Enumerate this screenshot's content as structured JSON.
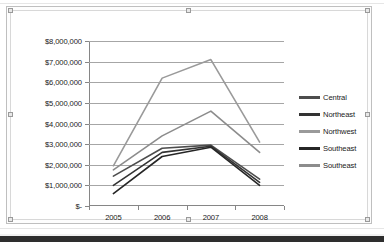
{
  "chart_data": {
    "type": "line",
    "title": "",
    "xlabel": "",
    "ylabel": "",
    "x": [
      "2005",
      "2006",
      "2007",
      "2008"
    ],
    "categories": [
      "2005",
      "2006",
      "2007",
      "2008"
    ],
    "ylim": [
      0,
      8000000
    ],
    "ytick_step": 1000000,
    "ytick_labels": [
      "$-",
      "$1,000,000",
      "$2,000,000",
      "$3,000,000",
      "$4,000,000",
      "$5,000,000",
      "$6,000,000",
      "$7,000,000",
      "$8,000,000"
    ],
    "ytick_values": [
      0,
      1000000,
      2000000,
      3000000,
      4000000,
      5000000,
      6000000,
      7000000,
      8000000
    ],
    "grid": "horizontal",
    "legend_position": "right",
    "series": [
      {
        "name": "Central",
        "color": "#4d4d4d",
        "values": [
          1450000,
          2800000,
          2950000,
          1300000
        ]
      },
      {
        "name": "Northeast",
        "color": "#333333",
        "values": [
          1000000,
          2600000,
          2900000,
          1150000
        ]
      },
      {
        "name": "Northwest",
        "color": "#9a9a9a",
        "values": [
          1950000,
          6200000,
          7100000,
          3100000
        ]
      },
      {
        "name": "Southeast",
        "color": "#262626",
        "values": [
          600000,
          2400000,
          2850000,
          1000000
        ]
      },
      {
        "name": "Southeast",
        "color": "#8c8c8c",
        "values": [
          1750000,
          3400000,
          4600000,
          2600000
        ]
      }
    ]
  },
  "legend": {
    "items": [
      {
        "label": "Central"
      },
      {
        "label": "Northeast"
      },
      {
        "label": "Northwest"
      },
      {
        "label": "Southeast"
      },
      {
        "label": "Southeast"
      }
    ]
  }
}
